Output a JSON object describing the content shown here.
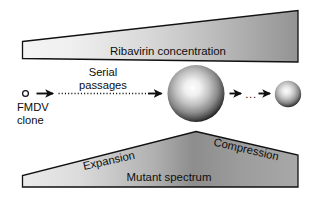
{
  "figure": {
    "background_color": "#ffffff"
  },
  "top_wedge": {
    "label": "Ribavirin concentration",
    "gradient_light": "#f2f2f2",
    "gradient_dark": "#9a9a9a",
    "outline_color": "#111111"
  },
  "flow": {
    "clone_label_line1": "FMDV",
    "clone_label_line2": "clone",
    "passages_label_line1": "Serial",
    "passages_label_line2": "passages",
    "ellipsis": "...",
    "arrow_1_name": "arrow-clone-to-passages",
    "arrow_2_name": "arrow-passages-to-large-sphere",
    "arrow_3_name": "arrow-large-sphere-to-ellipsis",
    "arrow_4_name": "arrow-ellipsis-to-small-sphere",
    "clone_circle_fill": "#ffffff",
    "clone_circle_stroke": "#111111",
    "sphere_highlight": "#fbfbfb",
    "sphere_mid": "#9f9f9f",
    "sphere_edge": "#1b1b1b"
  },
  "bottom_wedge": {
    "label_expansion": "Expansion",
    "label_compression": "Compression",
    "label_spectrum": "Mutant spectrum",
    "gradient_light": "#e6e6e6",
    "gradient_dark": "#6f6f6f",
    "outline_color": "#111111"
  }
}
